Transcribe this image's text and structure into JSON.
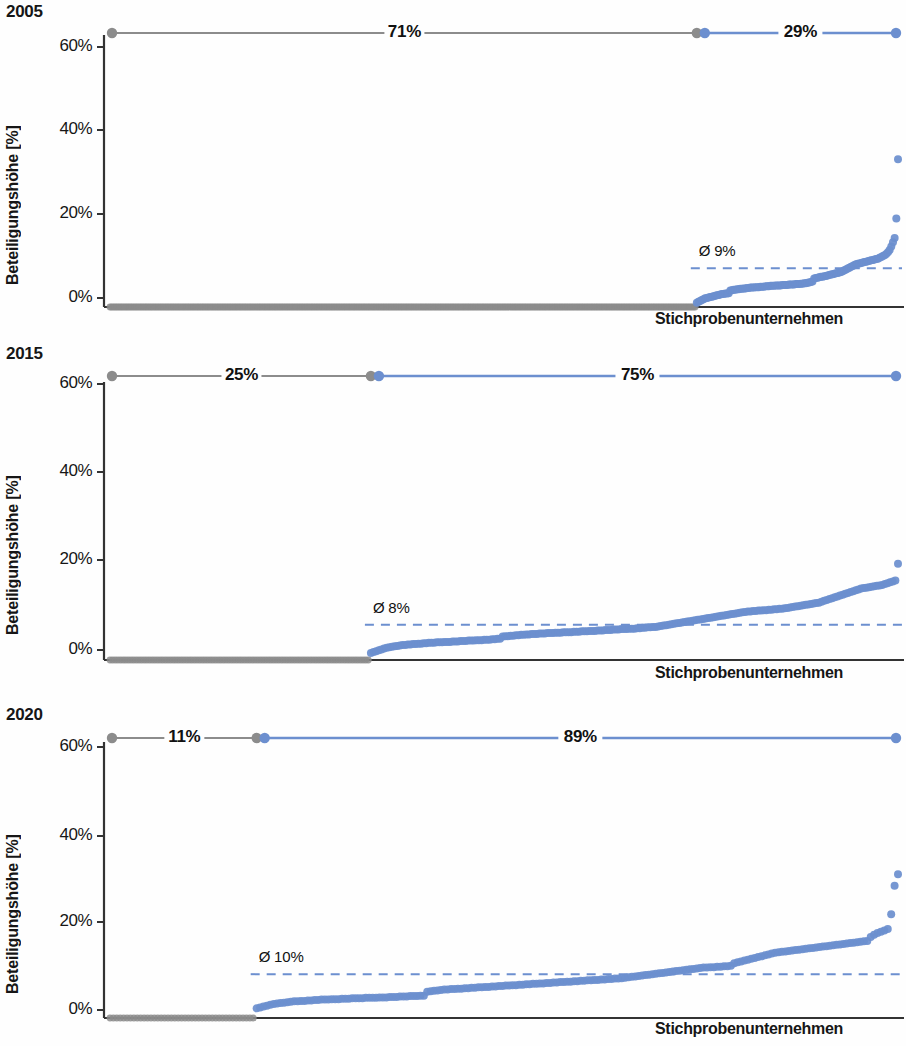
{
  "figure": {
    "axis_y_label": "Beteiligungshöhe [%]",
    "axis_x_label": "Stichprobenunternehmen",
    "y_ticks": [
      "0%",
      "20%",
      "40%",
      "60%"
    ],
    "colors": {
      "blue": "#6C8FCF",
      "gray": "#8C8C8C",
      "axis": "#333333",
      "dashed_avg": "#6C8FCF"
    }
  },
  "panels": [
    {
      "year": "2005",
      "gray_share_label": "71%",
      "blue_share_label": "29%",
      "avg_label": "Ø 9%",
      "avg_value": 9
    },
    {
      "year": "2015",
      "gray_share_label": "25%",
      "blue_share_label": "75%",
      "avg_label": "Ø 8%",
      "avg_value": 8
    },
    {
      "year": "2020",
      "gray_share_label": "11%",
      "blue_share_label": "89%",
      "avg_label": "Ø 10%",
      "avg_value": 10
    }
  ],
  "chart_data": [
    {
      "type": "scatter",
      "title": "2005",
      "xlabel": "Stichprobenunternehmen",
      "ylabel": "Beteiligungshöhe [%]",
      "ylim": [
        0,
        63
      ],
      "yticks": [
        0,
        20,
        40,
        60
      ],
      "grid": false,
      "legend": "none",
      "annotations": [
        {
          "text": "71%",
          "meaning": "share of sample companies with 0% holding",
          "color": "#8C8C8C"
        },
        {
          "text": "29%",
          "meaning": "share of sample companies with holding > 0%",
          "color": "#6C8FCF"
        },
        {
          "text": "Ø 9%",
          "meaning": "average holding among companies with holdings",
          "value": 9
        }
      ],
      "zero_group_fraction": 0.71,
      "nonzero_group_fraction": 0.29,
      "average_line": 9,
      "values": [
        0,
        0,
        0,
        0,
        0,
        0,
        0,
        0,
        0,
        0,
        0,
        0,
        0,
        0,
        0,
        0,
        0,
        0,
        0,
        0,
        0,
        0,
        0,
        0,
        0,
        0,
        0,
        0,
        0,
        0,
        0,
        0,
        0,
        0,
        0,
        0,
        0,
        0,
        0,
        0,
        0,
        0,
        0,
        0,
        0,
        0,
        0,
        0,
        0,
        0,
        0,
        0,
        0,
        0,
        0,
        0,
        0,
        0,
        0,
        0,
        0,
        0,
        0,
        0,
        0,
        0,
        0,
        0,
        0,
        0,
        0,
        0,
        0,
        0,
        0,
        0,
        0,
        0,
        0,
        0,
        0,
        0,
        0,
        0,
        0,
        0,
        0,
        0,
        0,
        0,
        0,
        0,
        0,
        0,
        0,
        0,
        0,
        0,
        0,
        0,
        0,
        0,
        0,
        0,
        0,
        0,
        0,
        0,
        0,
        0,
        0,
        0,
        0,
        0,
        0,
        0,
        0,
        0,
        0,
        0,
        0,
        0,
        0,
        0,
        0,
        0,
        0,
        0,
        0,
        0,
        0,
        0,
        0,
        0,
        0,
        0,
        0,
        0,
        0,
        0,
        0,
        0,
        0,
        0,
        0,
        0,
        0,
        0,
        0,
        0,
        0,
        0,
        0,
        0,
        0,
        0,
        0,
        0,
        0,
        0,
        0,
        0,
        0,
        0,
        0,
        0,
        0,
        0,
        0,
        0,
        0,
        0,
        0,
        0,
        0,
        0,
        0,
        0,
        0,
        0,
        0,
        0,
        0,
        0,
        0,
        0,
        0,
        0,
        0,
        0,
        0,
        0,
        0,
        0,
        0,
        0,
        0,
        0,
        0,
        0,
        0,
        0,
        0,
        0,
        0,
        0,
        0,
        0,
        0,
        0,
        0,
        0,
        0,
        0,
        0,
        0,
        0,
        0,
        0,
        0,
        0,
        0,
        0,
        0,
        0,
        0,
        0,
        0,
        0,
        0,
        0,
        0,
        0,
        0,
        0,
        0,
        0,
        0,
        0,
        0,
        0,
        0,
        0,
        0,
        0,
        0,
        0,
        0,
        0,
        0,
        0,
        0,
        0,
        0,
        0,
        0,
        0,
        0,
        0,
        0,
        0,
        0,
        0,
        0,
        0,
        0,
        0,
        0,
        0,
        0,
        0,
        0,
        0,
        0,
        0,
        0,
        0,
        0,
        0,
        0,
        0,
        0,
        0,
        0,
        0,
        0,
        0,
        0,
        0,
        0,
        0,
        0,
        0,
        0,
        0,
        0,
        0,
        0,
        0,
        0,
        0,
        0,
        0,
        0,
        0,
        0,
        0,
        0,
        0,
        0,
        0,
        0,
        0,
        0,
        0,
        0,
        0,
        0,
        0,
        0,
        0,
        0,
        0,
        0,
        0,
        0,
        0,
        0,
        0,
        0,
        0,
        0,
        0,
        0,
        0,
        0,
        0,
        0,
        0,
        0,
        0,
        0,
        0,
        0,
        0,
        0,
        0,
        0,
        0,
        0,
        1.0,
        1.2,
        1.4,
        1.6,
        1.8,
        2.0,
        2.1,
        2.2,
        2.3,
        2.4,
        2.5,
        2.6,
        2.7,
        2.8,
        2.9,
        3.0,
        3.0,
        3.1,
        3.1,
        3.2,
        3.8,
        3.9,
        4.0,
        4.0,
        4.1,
        4.1,
        4.2,
        4.2,
        4.3,
        4.3,
        4.4,
        4.4,
        4.5,
        4.5,
        4.5,
        4.6,
        4.6,
        4.6,
        4.7,
        4.7,
        4.7,
        4.8,
        4.8,
        4.8,
        4.9,
        4.9,
        4.9,
        5.0,
        5.0,
        5.0,
        5.0,
        5.1,
        5.1,
        5.1,
        5.1,
        5.2,
        5.2,
        5.2,
        5.2,
        5.3,
        5.3,
        5.3,
        5.4,
        5.4,
        5.5,
        5.5,
        5.6,
        5.7,
        5.8,
        5.9,
        6.6,
        6.7,
        6.8,
        6.9,
        7.0,
        7.0,
        7.1,
        7.2,
        7.3,
        7.4,
        7.5,
        7.6,
        7.7,
        7.8,
        7.9,
        8.0,
        8.1,
        8.3,
        8.5,
        8.7,
        8.9,
        9.1,
        9.3,
        9.5,
        9.7,
        9.9,
        10.0,
        10.1,
        10.2,
        10.3,
        10.4,
        10.5,
        10.6,
        10.7,
        10.8,
        10.9,
        11.0,
        11.1,
        11.2,
        11.4,
        11.6,
        11.8,
        12.0,
        12.3,
        12.7,
        13.2,
        14.0,
        15.0,
        16.0,
        20.5,
        34.2
      ]
    },
    {
      "type": "scatter",
      "title": "2015",
      "xlabel": "Stichprobenunternehmen",
      "ylabel": "Beteiligungshöhe [%]",
      "ylim": [
        0,
        63
      ],
      "yticks": [
        0,
        20,
        40,
        60
      ],
      "grid": false,
      "legend": "none",
      "annotations": [
        {
          "text": "25%",
          "meaning": "share of sample companies with 0% holding",
          "color": "#8C8C8C"
        },
        {
          "text": "75%",
          "meaning": "share of sample companies with holding > 0%",
          "color": "#6C8FCF"
        },
        {
          "text": "Ø 8%",
          "meaning": "average holding among companies with holdings",
          "value": 8
        }
      ],
      "zero_group_fraction": 0.25,
      "nonzero_group_fraction": 0.75,
      "average_line": 8,
      "values": [
        0,
        0,
        0,
        0,
        0,
        0,
        0,
        0,
        0,
        0,
        0,
        0,
        0,
        0,
        0,
        0,
        0,
        0,
        0,
        0,
        0,
        0,
        0,
        0,
        0,
        0,
        0,
        0,
        0,
        0,
        0,
        0,
        0,
        0,
        0,
        0,
        0,
        0,
        0,
        0,
        0,
        0,
        0,
        0,
        0,
        0,
        0,
        0,
        0,
        0,
        0,
        0,
        0,
        0,
        0,
        0,
        0,
        0,
        0,
        0,
        0,
        0,
        0,
        0,
        0,
        0,
        0,
        0,
        0,
        0,
        0,
        0,
        0,
        0,
        0,
        0,
        0,
        0,
        0,
        0,
        0,
        0,
        0,
        0,
        0,
        0,
        0,
        0,
        0,
        0,
        0,
        0,
        0,
        0,
        0,
        0,
        0,
        0,
        0,
        1.6,
        1.8,
        2.0,
        2.2,
        2.4,
        2.6,
        2.8,
        2.9,
        3.0,
        3.1,
        3.2,
        3.3,
        3.4,
        3.4,
        3.5,
        3.5,
        3.6,
        3.6,
        3.7,
        3.7,
        3.8,
        3.8,
        3.9,
        3.9,
        3.9,
        4.0,
        4.0,
        4.0,
        4.1,
        4.1,
        4.1,
        4.2,
        4.2,
        4.2,
        4.3,
        4.3,
        4.3,
        4.4,
        4.4,
        4.4,
        4.5,
        4.5,
        4.5,
        4.6,
        4.6,
        4.6,
        4.7,
        4.7,
        4.8,
        4.8,
        5.3,
        5.4,
        5.4,
        5.5,
        5.5,
        5.6,
        5.6,
        5.7,
        5.7,
        5.8,
        5.8,
        5.9,
        5.9,
        5.9,
        6.0,
        6.0,
        6.0,
        6.1,
        6.1,
        6.1,
        6.2,
        6.2,
        6.2,
        6.3,
        6.3,
        6.3,
        6.3,
        6.4,
        6.4,
        6.4,
        6.5,
        6.5,
        6.5,
        6.6,
        6.6,
        6.6,
        6.7,
        6.7,
        6.7,
        6.8,
        6.8,
        6.8,
        6.9,
        6.9,
        6.9,
        7.0,
        7.0,
        7.0,
        7.1,
        7.1,
        7.1,
        7.2,
        7.2,
        7.3,
        7.3,
        7.4,
        7.4,
        7.5,
        7.5,
        7.6,
        7.7,
        7.8,
        7.9,
        8.0,
        8.1,
        8.2,
        8.3,
        8.4,
        8.5,
        8.6,
        8.7,
        8.8,
        8.9,
        9.0,
        9.1,
        9.2,
        9.3,
        9.4,
        9.5,
        9.6,
        9.7,
        9.8,
        9.9,
        10.0,
        10.1,
        10.2,
        10.3,
        10.4,
        10.5,
        10.6,
        10.7,
        10.8,
        10.9,
        11.0,
        11.0,
        11.1,
        11.1,
        11.2,
        11.2,
        11.3,
        11.3,
        11.4,
        11.4,
        11.5,
        11.5,
        11.6,
        11.6,
        11.7,
        11.8,
        11.9,
        12.0,
        12.1,
        12.2,
        12.3,
        12.4,
        12.5,
        12.6,
        12.7,
        12.8,
        12.9,
        13.0,
        13.2,
        13.4,
        13.6,
        13.8,
        14.0,
        14.2,
        14.4,
        14.6,
        14.8,
        15.0,
        15.2,
        15.4,
        15.6,
        15.8,
        16.0,
        16.2,
        16.3,
        16.4,
        16.5,
        16.6,
        16.7,
        16.8,
        16.9,
        17.0,
        17.2,
        17.4,
        17.6,
        17.8,
        18.0,
        21.8
      ]
    },
    {
      "type": "scatter",
      "title": "2020",
      "xlabel": "Stichprobenunternehmen",
      "ylabel": "Beteiligungshöhe [%]",
      "ylim": [
        0,
        63
      ],
      "yticks": [
        0,
        20,
        40,
        60
      ],
      "grid": false,
      "legend": "none",
      "annotations": [
        {
          "text": "11%",
          "meaning": "share of sample companies with 0% holding",
          "color": "#8C8C8C"
        },
        {
          "text": "89%",
          "meaning": "share of sample companies with holding > 0%",
          "color": "#6C8FCF"
        },
        {
          "text": "Ø 10%",
          "meaning": "average holding among companies with holdings",
          "value": 10
        }
      ],
      "zero_group_fraction": 0.11,
      "nonzero_group_fraction": 0.89,
      "average_line": 10,
      "values": [
        0,
        0,
        0,
        0,
        0,
        0,
        0,
        0,
        0,
        0,
        0,
        0,
        0,
        0,
        0,
        0,
        0,
        0,
        0,
        0,
        0,
        0,
        0,
        0,
        0,
        0,
        0,
        0,
        0,
        0,
        0,
        0,
        0,
        0,
        0,
        0,
        0,
        0,
        0,
        0,
        0,
        0,
        0,
        2.2,
        2.4,
        2.6,
        2.8,
        3.0,
        3.2,
        3.3,
        3.4,
        3.5,
        3.6,
        3.7,
        3.8,
        3.8,
        3.9,
        3.9,
        4.0,
        4.0,
        4.1,
        4.1,
        4.2,
        4.2,
        4.2,
        4.3,
        4.3,
        4.3,
        4.4,
        4.4,
        4.4,
        4.5,
        4.5,
        4.5,
        4.5,
        4.6,
        4.6,
        4.6,
        4.6,
        4.7,
        4.7,
        4.7,
        4.8,
        4.8,
        4.8,
        4.9,
        4.9,
        4.9,
        5.0,
        5.0,
        5.0,
        5.1,
        5.1,
        6.0,
        6.1,
        6.2,
        6.3,
        6.4,
        6.5,
        6.5,
        6.6,
        6.6,
        6.7,
        6.7,
        6.8,
        6.8,
        6.9,
        6.9,
        7.0,
        7.0,
        7.1,
        7.1,
        7.2,
        7.2,
        7.3,
        7.3,
        7.4,
        7.4,
        7.5,
        7.5,
        7.6,
        7.6,
        7.7,
        7.7,
        7.8,
        7.8,
        7.9,
        7.9,
        8.0,
        8.0,
        8.1,
        8.1,
        8.2,
        8.2,
        8.3,
        8.3,
        8.4,
        8.4,
        8.5,
        8.5,
        8.6,
        8.6,
        8.7,
        8.7,
        8.8,
        8.8,
        8.9,
        8.9,
        9.0,
        9.0,
        9.1,
        9.2,
        9.3,
        9.4,
        9.5,
        9.6,
        9.7,
        9.8,
        9.9,
        10.0,
        10.1,
        10.2,
        10.3,
        10.4,
        10.5,
        10.6,
        10.7,
        10.8,
        10.9,
        11.0,
        11.1,
        11.2,
        11.3,
        11.4,
        11.5,
        11.5,
        11.6,
        11.6,
        11.7,
        11.7,
        11.8,
        11.8,
        11.9,
        12.5,
        12.7,
        12.9,
        13.1,
        13.3,
        13.5,
        13.7,
        13.9,
        14.1,
        14.3,
        14.5,
        14.7,
        14.9,
        15.0,
        15.1,
        15.2,
        15.3,
        15.4,
        15.5,
        15.6,
        15.7,
        15.8,
        15.9,
        16.0,
        16.1,
        16.2,
        16.3,
        16.4,
        16.5,
        16.6,
        16.7,
        16.8,
        16.9,
        17.0,
        17.1,
        17.2,
        17.3,
        17.4,
        17.5,
        17.6,
        18.5,
        19.0,
        19.4,
        19.7,
        20.0,
        20.3,
        23.7,
        30.2,
        32.8
      ]
    }
  ]
}
